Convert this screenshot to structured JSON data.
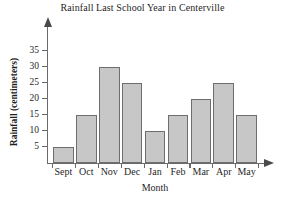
{
  "chart_data": {
    "type": "bar",
    "title": "Rainfall Last School Year in Centerville",
    "xlabel": "Month",
    "ylabel": "Rainfall (centimeters)",
    "categories": [
      "Sept",
      "Oct",
      "Nov",
      "Dec",
      "Jan",
      "Feb",
      "Mar",
      "Apr",
      "May"
    ],
    "values": [
      5,
      15,
      30,
      25,
      10,
      15,
      20,
      25,
      15
    ],
    "yticks": [
      5,
      10,
      15,
      20,
      25,
      30,
      35
    ],
    "ylim": [
      0,
      37
    ],
    "grid": false,
    "legend": false,
    "bar_color": "#c7c7c7",
    "bar_edge_color": "#6e6e6e",
    "axis_color": "#6a6a6a",
    "background_color": "#ffffff"
  }
}
